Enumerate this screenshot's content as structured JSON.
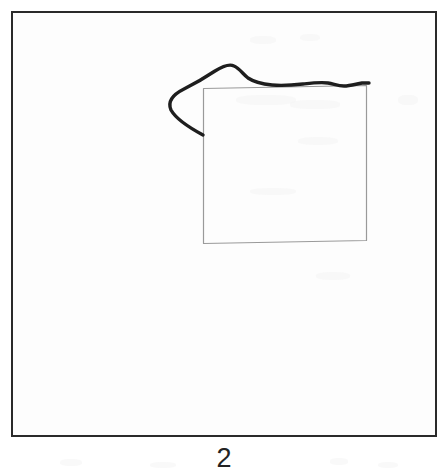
{
  "figure": {
    "caption": "2",
    "panel": {
      "border_color": "#2a2a2a",
      "background_color": "#fdfdfd",
      "x": 11,
      "y": 11,
      "width": 426,
      "height": 426
    },
    "shapes": [
      {
        "name": "reference-square",
        "style": "thin light-gray hand-drawn square outline",
        "color": "#9a9a9a",
        "stroke_width": 1.2,
        "path": "M 203.5 88.5 L 366.5 85.5 L 366.5 240.5 L 203.5 243.5 Z"
      },
      {
        "name": "traced-contour",
        "style": "thick dark hand-traced contour with left hook over the square top edge",
        "color": "#1e1e1e",
        "stroke_width": 3.4,
        "path": "M 203 135 C 190 128 176 119 171 110 C 167 101 174 94 184 89 C 196 83 206 77 215 71 C 223 66 230 64 234 66 C 239 68 243 74 248 78 C 254 82 262 84 272 85 C 283 86 294 85 303 84 C 312 83 320 82 328 83 C 334 84 338 86 344 86 C 350 86 356 84 362 83 C 366 83 368 83 369 83"
      }
    ],
    "paper_marks": [
      {
        "x": 250,
        "y": 36,
        "w": 26,
        "h": 8
      },
      {
        "x": 300,
        "y": 34,
        "w": 20,
        "h": 7
      },
      {
        "x": 236,
        "y": 95,
        "w": 60,
        "h": 10
      },
      {
        "x": 290,
        "y": 100,
        "w": 50,
        "h": 9
      },
      {
        "x": 398,
        "y": 95,
        "w": 20,
        "h": 10
      },
      {
        "x": 298,
        "y": 137,
        "w": 40,
        "h": 8
      },
      {
        "x": 250,
        "y": 188,
        "w": 46,
        "h": 7
      },
      {
        "x": 316,
        "y": 272,
        "w": 34,
        "h": 8
      },
      {
        "x": 60,
        "y": 459,
        "w": 22,
        "h": 7
      },
      {
        "x": 150,
        "y": 462,
        "w": 26,
        "h": 6
      },
      {
        "x": 330,
        "y": 458,
        "w": 18,
        "h": 7
      },
      {
        "x": 378,
        "y": 462,
        "w": 20,
        "h": 6
      }
    ]
  }
}
